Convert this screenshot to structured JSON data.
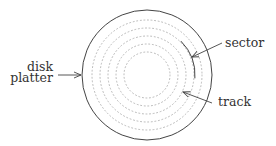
{
  "diagram": {
    "labels": {
      "disk_line1": "disk",
      "disk_line2": "platter",
      "sector": "sector",
      "track": "track"
    },
    "platter": {
      "cx": 147,
      "cy": 75,
      "r": 65
    },
    "track_radii": [
      55,
      47,
      39,
      31,
      23
    ],
    "sector_arc": {
      "r": 48,
      "start_deg": -45,
      "end_deg": 4
    },
    "colors": {
      "outline": "#444444",
      "tracks": "#b8b8b8",
      "text": "#333333",
      "background": "#ffffff"
    }
  }
}
